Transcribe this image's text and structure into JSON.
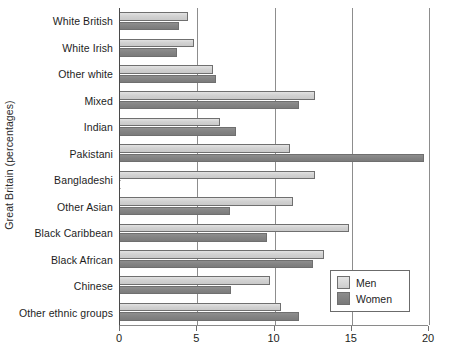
{
  "chart_data": {
    "type": "bar",
    "orientation": "horizontal",
    "title": "",
    "subtitle": "",
    "xlabel": "",
    "ylabel": "Great Britain (percentages)",
    "xlim": [
      0,
      20
    ],
    "xticks": [
      0,
      5,
      10,
      15,
      20
    ],
    "xtick_labels": [
      "0",
      "5",
      "10",
      "15",
      "20"
    ],
    "grid": true,
    "grid_axis": "x",
    "legend_position": "bottom-right",
    "categories": [
      "White British",
      "White Irish",
      "Other white",
      "Mixed",
      "Indian",
      "Pakistani",
      "Bangladeshi",
      "Other Asian",
      "Black Caribbean",
      "Black African",
      "Chinese",
      "Other ethnic groups"
    ],
    "series": [
      {
        "name": "Men",
        "color": "#d4d4d4",
        "values": [
          4.4,
          4.8,
          6.0,
          12.6,
          6.5,
          11.0,
          12.6,
          11.2,
          14.8,
          13.2,
          9.7,
          10.4
        ]
      },
      {
        "name": "Women",
        "color": "#848484",
        "values": [
          3.8,
          3.7,
          6.2,
          11.6,
          7.5,
          19.7,
          0.0,
          7.1,
          9.5,
          12.5,
          7.2,
          11.6
        ]
      }
    ]
  },
  "legend": {
    "items": [
      {
        "label": "Men",
        "swatch": "men"
      },
      {
        "label": "Women",
        "swatch": "women"
      }
    ]
  },
  "colors": {
    "men_bar": "#d4d4d4",
    "women_bar": "#848484",
    "bar_border": "#6f6f6f",
    "gridline": "#8d8d8d",
    "axis": "#4a4a4a",
    "text": "#1d1d1d",
    "background": "#ffffff"
  }
}
